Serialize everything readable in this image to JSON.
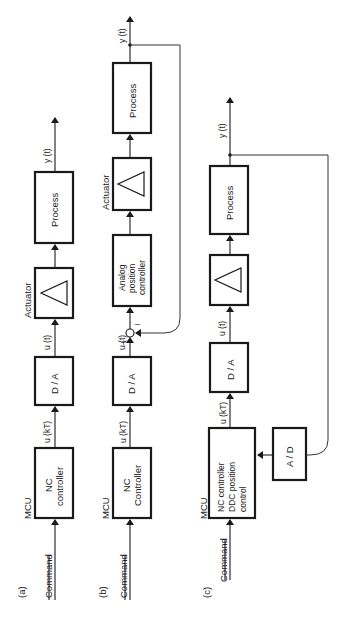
{
  "diagram": {
    "orientation": "rotated 90 degrees counter-clockwise",
    "panels": [
      {
        "id": "a",
        "label": "(a)",
        "input_label": "Command",
        "group_label": "MCU",
        "blocks": [
          {
            "name": "nc-controller",
            "lines": [
              "NC",
              "controller"
            ]
          },
          {
            "name": "d-a",
            "lines": [
              "D / A"
            ]
          },
          {
            "name": "actuator",
            "lines": [],
            "caption": "Actuator",
            "symbol": "triangle"
          },
          {
            "name": "process",
            "lines": [
              "Process"
            ]
          }
        ],
        "signals": {
          "ukt": "u (kT)",
          "ut": "u (t)",
          "yt": "y (t)"
        }
      },
      {
        "id": "b",
        "label": "(b)",
        "input_label": "Command",
        "group_label": "MCU",
        "blocks": [
          {
            "name": "nc-controller",
            "lines": [
              "NC",
              "Controller"
            ]
          },
          {
            "name": "d-a",
            "lines": [
              "D / A"
            ]
          },
          {
            "name": "analog-position-controller",
            "lines": [
              "Analog",
              "position",
              "controller"
            ]
          },
          {
            "name": "actuator",
            "lines": [],
            "caption": "Actuator",
            "symbol": "triangle"
          },
          {
            "name": "process",
            "lines": [
              "Process"
            ]
          }
        ],
        "signals": {
          "ukt": "u (kT)",
          "ut": "u (t)",
          "yt": "y (t)"
        },
        "summing_junction": {
          "plus": "+",
          "minus": "–"
        }
      },
      {
        "id": "c",
        "label": "(c)",
        "input_label": "Command",
        "group_label": "MCU",
        "blocks": [
          {
            "name": "nc-ddc-controller",
            "lines": [
              "NC   controller",
              "DDC   position",
              "control"
            ]
          },
          {
            "name": "d-a",
            "lines": [
              "D / A"
            ]
          },
          {
            "name": "actuator",
            "lines": [],
            "symbol": "triangle"
          },
          {
            "name": "process",
            "lines": [
              "Process"
            ]
          },
          {
            "name": "a-d",
            "lines": [
              "A / D"
            ]
          }
        ],
        "signals": {
          "ukt": "u (kT)",
          "ut": "u (t)",
          "yt": "y (t)"
        }
      }
    ]
  }
}
